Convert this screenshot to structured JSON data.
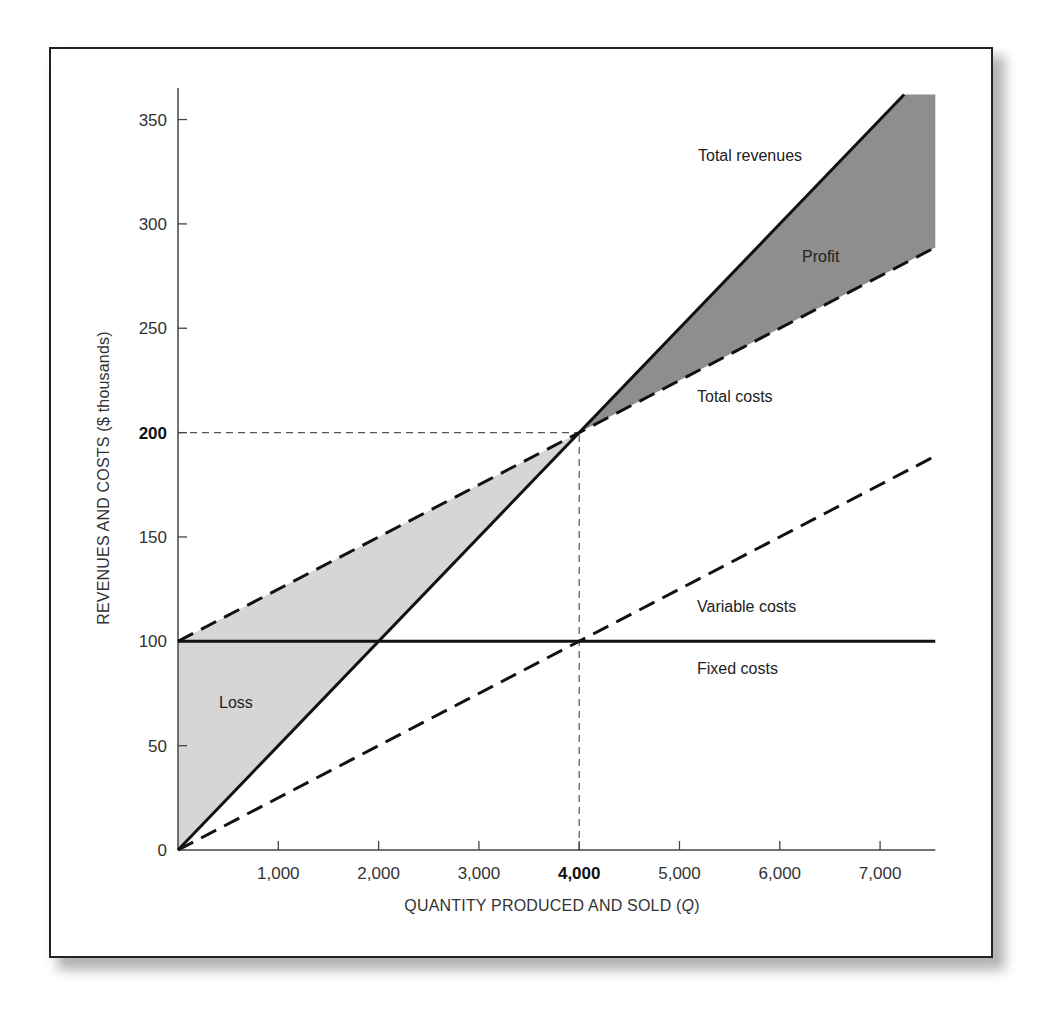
{
  "chart_data": {
    "type": "line",
    "title": "",
    "xlabel": "QUANTITY PRODUCED AND SOLD (Q)",
    "xlabel_parts": {
      "prefix": "QUANTITY PRODUCED AND SOLD (",
      "italic": "Q",
      "suffix": ")"
    },
    "ylabel": "REVENUES AND COSTS ($ thousands)",
    "xlim": [
      0,
      7550
    ],
    "ylim": [
      0,
      362
    ],
    "grid": false,
    "legend": "inline labels",
    "x_ticks": [
      {
        "value": 1000,
        "label": "1,000",
        "bold": false
      },
      {
        "value": 2000,
        "label": "2,000",
        "bold": false
      },
      {
        "value": 3000,
        "label": "3,000",
        "bold": false
      },
      {
        "value": 4000,
        "label": "4,000",
        "bold": true
      },
      {
        "value": 5000,
        "label": "5,000",
        "bold": false
      },
      {
        "value": 6000,
        "label": "6,000",
        "bold": false
      },
      {
        "value": 7000,
        "label": "7,000",
        "bold": false
      }
    ],
    "y_ticks": [
      {
        "value": 0,
        "label": "0",
        "bold": false
      },
      {
        "value": 50,
        "label": "50",
        "bold": false
      },
      {
        "value": 100,
        "label": "100",
        "bold": false
      },
      {
        "value": 150,
        "label": "150",
        "bold": false
      },
      {
        "value": 200,
        "label": "200",
        "bold": true
      },
      {
        "value": 250,
        "label": "250",
        "bold": false
      },
      {
        "value": 300,
        "label": "300",
        "bold": false
      },
      {
        "value": 350,
        "label": "350",
        "bold": false
      }
    ],
    "series": [
      {
        "name": "Total revenues",
        "style": "solid",
        "width": 3,
        "color": "#111111",
        "x": [
          0,
          7240
        ],
        "values": [
          0,
          362
        ]
      },
      {
        "name": "Total costs",
        "style": "dashed",
        "width": 3,
        "color": "#111111",
        "x": [
          0,
          7550
        ],
        "values": [
          100,
          288.75
        ]
      },
      {
        "name": "Variable costs",
        "style": "dashed",
        "width": 3,
        "color": "#111111",
        "x": [
          0,
          7550
        ],
        "values": [
          0,
          188.75
        ]
      },
      {
        "name": "Fixed costs",
        "style": "solid",
        "width": 3,
        "color": "#111111",
        "x": [
          0,
          7550
        ],
        "values": [
          100,
          100
        ]
      }
    ],
    "regions": [
      {
        "name": "Loss",
        "color": "#d6d6d6",
        "points": [
          [
            0,
            0
          ],
          [
            0,
            100
          ],
          [
            4000,
            200
          ]
        ]
      },
      {
        "name": "Profit",
        "color": "#8e8e8e",
        "points": [
          [
            4000,
            200
          ],
          [
            7240,
            362
          ],
          [
            7550,
            362
          ],
          [
            7550,
            288.75
          ]
        ]
      }
    ],
    "reference_lines": [
      {
        "name": "break-even-revenue",
        "from": [
          0,
          200
        ],
        "to": [
          4000,
          200
        ]
      },
      {
        "name": "break-even-quantity",
        "from": [
          4000,
          0
        ],
        "to": [
          4000,
          200
        ]
      }
    ],
    "break_even": {
      "quantity": 4000,
      "value": 200
    },
    "annotations": [
      {
        "text": "Total revenues",
        "x": 698,
        "y": 161
      },
      {
        "text": "Profit",
        "x": 802,
        "y": 262
      },
      {
        "text": "Total costs",
        "x": 697,
        "y": 402
      },
      {
        "text": "Variable costs",
        "x": 697,
        "y": 612
      },
      {
        "text": "Fixed costs",
        "x": 697,
        "y": 674
      },
      {
        "text": "Loss",
        "x": 219,
        "y": 708
      }
    ]
  }
}
